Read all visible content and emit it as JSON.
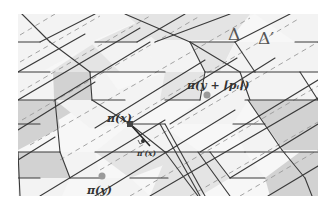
{
  "figure": {
    "width": 336,
    "height": 210,
    "clip": {
      "x": 18,
      "y": 14,
      "w": 300,
      "h": 182
    },
    "colors": {
      "background": "#ffffff",
      "tile_light": "#f3f3f3",
      "tile_mid": "#e4e4e4",
      "tile_dark": "#d2d2d2",
      "edge": "#3a3a3a",
      "dashed": "#9a9a9a",
      "point_x": "#444444",
      "point_y": "#9a9a9a",
      "label": "#333333"
    }
  },
  "labels": {
    "delta": "Δ",
    "delta_prime": "Δ′",
    "pi_x": "π(x)",
    "pi_prime_x": "π′(x)",
    "pi_y": "π(y)",
    "pi_y_shift": "π(y + ⌈pᵢ⌉)"
  },
  "label_positions": {
    "delta": {
      "x": 228,
      "y": 40,
      "size": 17
    },
    "delta_prime": {
      "x": 258,
      "y": 44,
      "size": 17
    },
    "pi_x": {
      "x": 107,
      "y": 122,
      "size": 11
    },
    "pi_prime_x": {
      "x": 137,
      "y": 156,
      "size": 7.5
    },
    "pi_y": {
      "x": 87,
      "y": 194,
      "size": 11
    },
    "pi_y_shift": {
      "x": 187,
      "y": 89,
      "size": 11
    }
  },
  "points": {
    "pi_x": {
      "x": 130,
      "y": 124,
      "shape": "square",
      "size": 6
    },
    "pi_y": {
      "x": 102,
      "y": 176,
      "shape": "circle",
      "r": 3.5
    },
    "pi_y_shift": {
      "x": 207,
      "y": 95,
      "shape": "circle",
      "r": 3.5
    },
    "pi_prime_x": {
      "x": 143,
      "y": 141,
      "shape": "circle",
      "r": 2
    }
  },
  "tiles": [
    {
      "pts": "18,14 70,14 95,42 45,70 18,70",
      "shade": "tile_light"
    },
    {
      "pts": "70,14 155,14 90,42 95,42",
      "shade": "tile_light"
    },
    {
      "pts": "95,42 155,14 205,14 140,42",
      "shade": "tile_mid"
    },
    {
      "pts": "205,14 255,14 190,42 140,42",
      "shade": "tile_light"
    },
    {
      "pts": "255,14 318,14 318,42 295,42 255,14",
      "shade": "tile_light"
    },
    {
      "pts": "125,14 250,14 250,14 230,40 155,40",
      "shade": "tile_mid"
    },
    {
      "pts": "18,72 50,72 55,100 18,120",
      "shade": "tile_light"
    },
    {
      "pts": "50,72 95,42 140,42 105,72",
      "shade": "tile_light"
    },
    {
      "pts": "55,72 105,72 125,100 75,100",
      "shade": "tile_light"
    },
    {
      "pts": "55,72 105,72 90,42",
      "shade": "tile_light"
    },
    {
      "pts": "50,72 93,44 137,44 137,72",
      "shade": "tile_mid"
    },
    {
      "pts": "53,72 90,72 92,100 55,122",
      "shade": "tile_dark"
    },
    {
      "pts": "90,42 137,42 165,72 120,72",
      "shade": "tile_light"
    },
    {
      "pts": "137,42 190,42 205,72 165,72",
      "shade": "tile_light"
    },
    {
      "pts": "190,42 235,42 220,72 205,72",
      "shade": "tile_mid"
    },
    {
      "pts": "235,42 295,42 255,72 220,72",
      "shade": "tile_light"
    },
    {
      "pts": "295,42 318,42 318,72 255,72",
      "shade": "tile_light"
    },
    {
      "pts": "18,100 55,100 60,128 18,150",
      "shade": "tile_dark"
    },
    {
      "pts": "55,100 92,100 130,124 90,128",
      "shade": "tile_light"
    },
    {
      "pts": "92,100 165,72 205,72 130,124",
      "shade": "tile_light"
    },
    {
      "pts": "165,72 205,72 200,100 160,100",
      "shade": "tile_mid"
    },
    {
      "pts": "205,72 255,72 245,100 200,100",
      "shade": "tile_light"
    },
    {
      "pts": "255,72 300,72 318,100 245,100",
      "shade": "tile_light"
    },
    {
      "pts": "248,100 300,100 318,100 318,150 282,150",
      "shade": "tile_dark"
    },
    {
      "pts": "18,152 60,152 70,178 18,196",
      "shade": "tile_dark"
    },
    {
      "pts": "60,152 95,152 100,178 70,178",
      "shade": "tile_light"
    },
    {
      "pts": "95,152 160,124 198,152 130,178",
      "shade": "tile_mid"
    },
    {
      "pts": "130,124 160,124 200,152 95,152",
      "shade": "tile_light"
    },
    {
      "pts": "168,152 210,152 230,178 200,196 150,196",
      "shade": "tile_mid"
    },
    {
      "pts": "210,152 245,152 265,178 230,178",
      "shade": "tile_light"
    },
    {
      "pts": "233,124 265,124 285,152 245,152",
      "shade": "tile_light"
    },
    {
      "pts": "265,178 300,152 318,152 318,196 270,196",
      "shade": "tile_dark"
    },
    {
      "pts": "200,100 248,100 233,124 170,124",
      "shade": "tile_light"
    },
    {
      "pts": "100,178 130,178 150,196 90,196",
      "shade": "tile_light"
    },
    {
      "pts": "18,178 70,178 62,196 18,196",
      "shade": "tile_light"
    }
  ],
  "edges": [
    [
      18,
      42,
      40,
      42
    ],
    [
      95,
      42,
      137,
      42
    ],
    [
      190,
      42,
      235,
      42
    ],
    [
      295,
      42,
      318,
      42
    ],
    [
      18,
      72,
      50,
      72
    ],
    [
      90,
      72,
      165,
      72
    ],
    [
      205,
      72,
      255,
      72
    ],
    [
      300,
      72,
      318,
      72
    ],
    [
      18,
      100,
      55,
      100
    ],
    [
      92,
      100,
      125,
      100
    ],
    [
      165,
      100,
      200,
      100
    ],
    [
      245,
      100,
      318,
      100
    ],
    [
      18,
      124,
      40,
      124
    ],
    [
      130,
      124,
      165,
      124
    ],
    [
      233,
      124,
      265,
      124
    ],
    [
      18,
      152,
      60,
      152
    ],
    [
      95,
      152,
      168,
      152
    ],
    [
      210,
      152,
      245,
      152
    ],
    [
      285,
      152,
      318,
      152
    ],
    [
      18,
      178,
      40,
      178
    ],
    [
      70,
      178,
      100,
      178
    ],
    [
      130,
      178,
      168,
      178
    ],
    [
      230,
      178,
      265,
      178
    ],
    [
      22,
      14,
      50,
      42
    ],
    [
      50,
      42,
      90,
      72
    ],
    [
      90,
      72,
      92,
      100
    ],
    [
      92,
      100,
      130,
      124
    ],
    [
      130,
      124,
      165,
      152
    ],
    [
      165,
      152,
      198,
      196
    ],
    [
      40,
      42,
      95,
      14
    ],
    [
      18,
      72,
      85,
      34
    ],
    [
      55,
      100,
      150,
      42
    ],
    [
      95,
      128,
      205,
      60
    ],
    [
      130,
      124,
      237,
      58
    ],
    [
      170,
      124,
      275,
      58
    ],
    [
      200,
      152,
      318,
      80
    ],
    [
      95,
      196,
      235,
      110
    ],
    [
      150,
      196,
      318,
      98
    ],
    [
      230,
      178,
      318,
      124
    ],
    [
      268,
      196,
      318,
      166
    ],
    [
      18,
      100,
      140,
      28
    ],
    [
      18,
      130,
      95,
      82
    ],
    [
      18,
      160,
      55,
      137
    ],
    [
      40,
      196,
      165,
      120
    ],
    [
      125,
      14,
      190,
      42
    ],
    [
      190,
      42,
      205,
      72
    ],
    [
      205,
      72,
      200,
      100
    ],
    [
      155,
      42,
      230,
      14
    ],
    [
      137,
      42,
      185,
      14
    ],
    [
      235,
      42,
      290,
      14
    ],
    [
      235,
      42,
      255,
      72
    ],
    [
      255,
      72,
      300,
      72
    ],
    [
      300,
      72,
      318,
      100
    ],
    [
      248,
      100,
      282,
      150
    ],
    [
      282,
      150,
      305,
      178
    ],
    [
      305,
      178,
      312,
      196
    ],
    [
      55,
      100,
      60,
      152
    ],
    [
      60,
      152,
      70,
      178
    ],
    [
      18,
      152,
      20,
      196
    ],
    [
      165,
      152,
      210,
      152
    ],
    [
      210,
      152,
      230,
      178
    ],
    [
      245,
      152,
      285,
      152
    ],
    [
      190,
      42,
      240,
      72
    ],
    [
      240,
      72,
      250,
      100
    ],
    [
      160,
      124,
      200,
      196
    ],
    [
      165,
      124,
      205,
      196
    ],
    [
      198,
      152,
      230,
      196
    ]
  ],
  "dashed_lines": [
    [
      20,
      35,
      55,
      14
    ],
    [
      20,
      62,
      100,
      16
    ],
    [
      20,
      92,
      150,
      16
    ],
    [
      22,
      120,
      200,
      16
    ],
    [
      30,
      145,
      250,
      18
    ],
    [
      60,
      160,
      300,
      18
    ],
    [
      100,
      170,
      318,
      42
    ],
    [
      130,
      196,
      318,
      86
    ],
    [
      190,
      196,
      318,
      122
    ],
    [
      240,
      196,
      318,
      150
    ]
  ],
  "perp_marker": {
    "x1": 130,
    "y1": 124,
    "x2": 150,
    "y2": 146
  }
}
